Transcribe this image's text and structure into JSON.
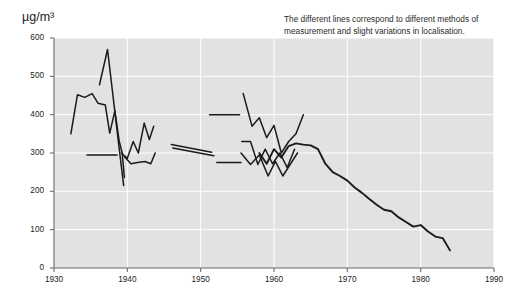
{
  "figure": {
    "y_axis_label": "µg/m³",
    "annotation": "The different lines correspond to different methods of measurement and slight variations in localisation.",
    "colors": {
      "plot_background": "#e2e2e2",
      "gridline": "#ffffff",
      "axis": "#6b6b6b",
      "line": "#1a1a1a",
      "text": "#1c1c1c",
      "page_background": "#ffffff"
    }
  },
  "chart_data": {
    "type": "line",
    "title": "",
    "subtitle": "",
    "annotation": "The different lines correspond to different methods of measurement and slight variations in localisation.",
    "xlabel": "",
    "ylabel": "µg/m³",
    "xlim": [
      1930,
      1990
    ],
    "ylim": [
      0,
      600
    ],
    "xticks": [
      1930,
      1940,
      1950,
      1960,
      1970,
      1980,
      1990
    ],
    "xtick_labels": [
      "1930",
      "1940",
      "1950",
      "1960",
      "1970",
      "1980",
      "1990"
    ],
    "yticks": [
      0,
      100,
      200,
      300,
      400,
      500,
      600
    ],
    "ytick_labels": [
      "0",
      "100",
      "200",
      "300",
      "400",
      "500",
      "600"
    ],
    "grid": true,
    "grid_axis": "both",
    "legend": false,
    "legend_position": "none",
    "series": [
      {
        "name": "method-a-early",
        "x": [
          1932.3,
          1933.2,
          1934.2,
          1935.2,
          1936.0,
          1937.0,
          1937.6,
          1938.3,
          1938.9,
          1939.3,
          1939.6
        ],
        "values": [
          350,
          452,
          445,
          455,
          430,
          425,
          352,
          410,
          330,
          300,
          236
        ]
      },
      {
        "name": "method-b-early-peak",
        "x": [
          1936.2,
          1937.3,
          1938.9,
          1939.5
        ],
        "values": [
          478,
          570,
          310,
          215
        ]
      },
      {
        "name": "method-c-flat-1930s",
        "x": [
          1934.5,
          1938.6
        ],
        "values": [
          295,
          295
        ]
      },
      {
        "name": "method-d-late-1930s",
        "x": [
          1939.2,
          1940.0,
          1940.8,
          1941.5,
          1942.3,
          1943.0,
          1943.6
        ],
        "values": [
          300,
          286,
          330,
          300,
          378,
          335,
          370
        ]
      },
      {
        "name": "method-e-late-1930s-low",
        "x": [
          1939.6,
          1940.5,
          1941.4,
          1942.4,
          1943.2,
          1943.8
        ],
        "values": [
          290,
          272,
          275,
          278,
          272,
          300
        ]
      },
      {
        "name": "method-f-mid-1940s-upper",
        "x": [
          1946.0,
          1951.5
        ],
        "values": [
          322,
          302
        ]
      },
      {
        "name": "method-g-mid-1940s-lower",
        "x": [
          1946.2,
          1951.8
        ],
        "values": [
          313,
          293
        ]
      },
      {
        "name": "method-h-flat-400",
        "x": [
          1951.2,
          1955.3
        ],
        "values": [
          400,
          400
        ]
      },
      {
        "name": "method-i-flat-275",
        "x": [
          1952.2,
          1955.5
        ],
        "values": [
          275,
          275
        ]
      },
      {
        "name": "method-j-1956-upper",
        "x": [
          1955.8,
          1957.0,
          1958.0,
          1959.0,
          1960.0,
          1961.0,
          1962.0,
          1963.0,
          1964.0
        ],
        "values": [
          455,
          370,
          392,
          340,
          372,
          300,
          330,
          350,
          400
        ]
      },
      {
        "name": "method-k-1956-mid",
        "x": [
          1955.6,
          1956.8,
          1957.8,
          1958.8,
          1959.8,
          1960.8,
          1961.8,
          1962.8
        ],
        "values": [
          330,
          330,
          270,
          310,
          272,
          300,
          262,
          310
        ]
      },
      {
        "name": "method-l-1956-low",
        "x": [
          1955.5,
          1956.8,
          1958.0,
          1959.2,
          1960.2,
          1961.2,
          1962.2,
          1963.2
        ],
        "values": [
          300,
          270,
          295,
          240,
          278,
          240,
          270,
          300
        ]
      },
      {
        "name": "main-declining-trend",
        "x": [
          1958.0,
          1959.0,
          1960.0,
          1961.0,
          1962.0,
          1963.0,
          1964.0,
          1965.0,
          1966.0,
          1967.0,
          1968.0,
          1969.0,
          1970.0,
          1971.0,
          1972.0,
          1973.0,
          1974.0,
          1975.0,
          1976.0,
          1977.0,
          1978.0,
          1979.0,
          1980.0,
          1981.0,
          1982.0,
          1983.0,
          1984.0
        ],
        "values": [
          300,
          272,
          310,
          288,
          318,
          325,
          322,
          320,
          310,
          272,
          250,
          240,
          228,
          210,
          196,
          180,
          165,
          152,
          148,
          132,
          120,
          108,
          112,
          95,
          82,
          78,
          46
        ]
      }
    ]
  }
}
